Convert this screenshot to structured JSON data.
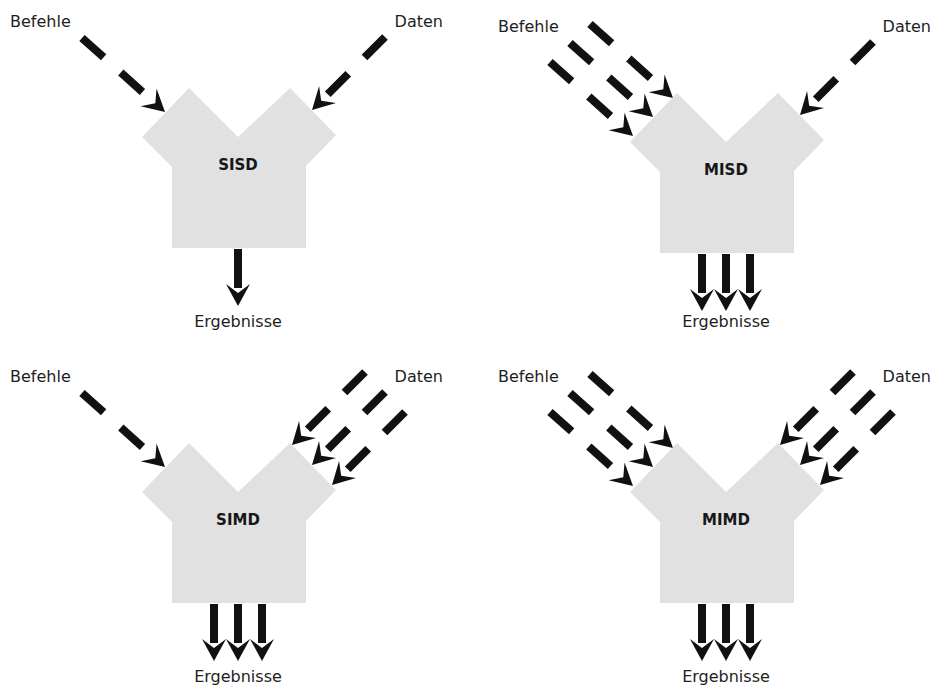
{
  "diagram": {
    "colors": {
      "shape_fill": "#e1e1e1",
      "arrow": "#111111",
      "text": "#1e1e1e",
      "background": "#ffffff"
    },
    "quadrants": [
      {
        "id": "sisd",
        "label": "SISD",
        "instruction_label": "Befehle",
        "data_label": "Daten",
        "result_label": "Ergebnisse",
        "instruction_streams": 1,
        "data_streams": 1,
        "result_streams": 1,
        "offset": [
          0,
          0
        ]
      },
      {
        "id": "misd",
        "label": "MISD",
        "instruction_label": "Befehle",
        "data_label": "Daten",
        "result_label": "Ergebnisse",
        "instruction_streams": 3,
        "data_streams": 1,
        "result_streams": 3,
        "offset": [
          488,
          5
        ]
      },
      {
        "id": "simd",
        "label": "SIMD",
        "instruction_label": "Befehle",
        "data_label": "Daten",
        "result_label": "Ergebnisse",
        "instruction_streams": 1,
        "data_streams": 3,
        "result_streams": 3,
        "offset": [
          0,
          355
        ]
      },
      {
        "id": "mimd",
        "label": "MIMD",
        "instruction_label": "Befehle",
        "data_label": "Daten",
        "result_label": "Ergebnisse",
        "instruction_streams": 3,
        "data_streams": 3,
        "result_streams": 3,
        "offset": [
          488,
          355
        ]
      }
    ]
  }
}
